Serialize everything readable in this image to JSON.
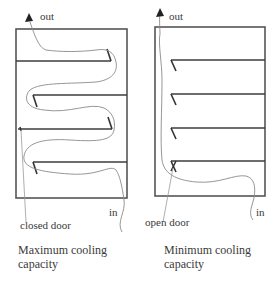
{
  "diagram": {
    "type": "airflow-comparison",
    "panels": [
      {
        "id": "left",
        "out_label": "out",
        "in_label": "in",
        "door_label": "closed door",
        "caption_line1": "Maximum cooling",
        "caption_line2": "capacity",
        "shelves": 4,
        "door_state": "closed",
        "flow": "serpentine"
      },
      {
        "id": "right",
        "out_label": "out",
        "in_label": "in",
        "door_label": "open door",
        "caption_line1": "Minimum cooling",
        "caption_line2": "capacity",
        "shelves": 4,
        "door_state": "open",
        "flow": "bypass"
      }
    ],
    "colors": {
      "line": "#3c3c3c",
      "flow": "#8a8a8a",
      "text": "#3a3a3a",
      "background": "#ffffff"
    }
  }
}
